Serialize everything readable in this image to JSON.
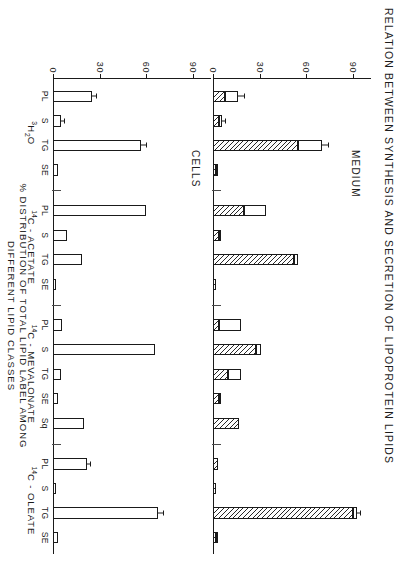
{
  "figure": {
    "title": "RELATION  BETWEEN  SYNTHESIS  AND  SECRETION  OF  LIPOPROTEIN  LIPIDS",
    "axis_title_line1": "%  DISTRIBUTION  OF  TOTAL  LIPID  LABEL  AMONG",
    "axis_title_line2": "DIFFERENT  LIPID  CLASSES"
  },
  "panels": [
    {
      "id": "medium",
      "label": "MEDIUM"
    },
    {
      "id": "cells",
      "label": "CELLS"
    }
  ],
  "axis": {
    "ticks": [
      "0",
      "30",
      "60",
      "90"
    ],
    "tick_values": [
      0,
      30,
      60,
      90
    ],
    "min": 0,
    "max": 98
  },
  "groups": [
    {
      "id": "h2o",
      "label_main": "H",
      "label_pre": "3",
      "label_post": "O",
      "label_sub": "2",
      "label_plain": "3H2O",
      "categories": [
        "PL",
        "S",
        "TG",
        "SE"
      ]
    },
    {
      "id": "acetate",
      "label_main": "C - ACETATE",
      "label_pre": "14",
      "label_post": "",
      "label_sub": "",
      "label_plain": "14C-ACETATE",
      "categories": [
        "PL",
        "S",
        "TG",
        "SE"
      ]
    },
    {
      "id": "mevalonate",
      "label_main": "C - MEVALONATE",
      "label_pre": "14",
      "label_post": "",
      "label_sub": "",
      "label_plain": "14C-MEVALONATE",
      "categories": [
        "PL",
        "S",
        "TG",
        "SE",
        "Sq"
      ]
    },
    {
      "id": "oleate",
      "label_main": "C - OLEATE",
      "label_pre": "14",
      "label_post": "",
      "label_sub": "",
      "label_plain": "14C-OLEATE",
      "categories": [
        "PL",
        "S",
        "TG",
        "SE"
      ]
    }
  ],
  "chart_data": {
    "type": "bar",
    "title": "RELATION  BETWEEN  SYNTHESIS  AND  SECRETION  OF  LIPOPROTEIN  LIPIDS",
    "orientation": "horizontal-rotated",
    "xlabel": "",
    "ylabel": "%  DISTRIBUTION  OF  TOTAL  LIPID  LABEL  AMONG  DIFFERENT  LIPID  CLASSES",
    "ylim": [
      0,
      98
    ],
    "yticks": [
      0,
      30,
      60,
      90
    ],
    "grid": false,
    "legend": "none",
    "panels": [
      {
        "panel": "MEDIUM",
        "series_styles": [
          "hatched",
          "open"
        ],
        "groups": [
          {
            "group": "3H2O",
            "categories": [
              "PL",
              "S",
              "TG",
              "SE"
            ],
            "hatched": [
              8,
              4,
              55,
              2
            ],
            "open": [
              8,
              2,
              15,
              1
            ],
            "total": [
              16,
              6,
              70,
              3
            ],
            "error": [
              4,
              1.5,
              4,
              0
            ]
          },
          {
            "group": "14C-ACETATE",
            "categories": [
              "PL",
              "S",
              "TG",
              "SE"
            ],
            "hatched": [
              20,
              4,
              52,
              2
            ],
            "open": [
              14,
              1,
              3,
              0
            ],
            "total": [
              34,
              5,
              55,
              2
            ],
            "error": [
              0,
              0,
              0,
              0
            ]
          },
          {
            "group": "14C-MEVALONATE",
            "categories": [
              "PL",
              "S",
              "TG",
              "SE",
              "Sq"
            ],
            "hatched": [
              4,
              28,
              10,
              4,
              17
            ],
            "open": [
              14,
              3,
              8,
              1,
              0
            ],
            "total": [
              18,
              31,
              18,
              5,
              17
            ],
            "error": [
              0,
              0,
              0,
              0,
              0
            ]
          },
          {
            "group": "14C-OLEATE",
            "categories": [
              "PL",
              "S",
              "TG",
              "SE"
            ],
            "hatched": [
              3,
              2,
              90,
              2
            ],
            "open": [
              0,
              0,
              3,
              1
            ],
            "total": [
              3,
              2,
              93,
              3
            ],
            "error": [
              0,
              0,
              2,
              0
            ]
          }
        ]
      },
      {
        "panel": "CELLS",
        "series_styles": [
          "open"
        ],
        "groups": [
          {
            "group": "3H2O",
            "categories": [
              "PL",
              "S",
              "TG",
              "SE"
            ],
            "open": [
              25,
              5,
              57,
              3
            ],
            "total": [
              25,
              5,
              57,
              3
            ],
            "error": [
              3,
              2,
              3,
              0
            ]
          },
          {
            "group": "14C-ACETATE",
            "categories": [
              "PL",
              "S",
              "TG",
              "SE"
            ],
            "open": [
              60,
              9,
              19,
              2
            ],
            "total": [
              60,
              9,
              19,
              2
            ],
            "error": [
              0,
              0,
              0,
              0
            ]
          },
          {
            "group": "14C-MEVALONATE",
            "categories": [
              "PL",
              "S",
              "TG",
              "SE",
              "Sq"
            ],
            "open": [
              6,
              66,
              5,
              3,
              20
            ],
            "total": [
              6,
              66,
              5,
              3,
              20
            ],
            "error": [
              0,
              0,
              0,
              0,
              0
            ]
          },
          {
            "group": "14C-OLEATE",
            "categories": [
              "PL",
              "S",
              "TG",
              "SE"
            ],
            "open": [
              22,
              2,
              68,
              3
            ],
            "total": [
              22,
              2,
              68,
              3
            ],
            "error": [
              2,
              0,
              3,
              0
            ]
          }
        ]
      }
    ]
  }
}
